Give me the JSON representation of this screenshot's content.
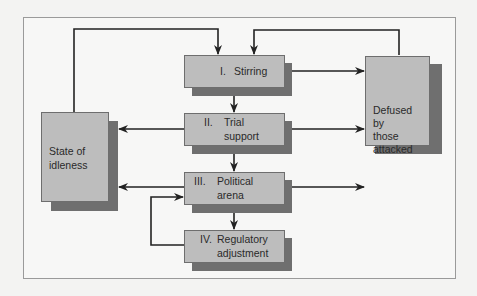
{
  "diagram": {
    "type": "flowchart",
    "colors": {
      "box_fill": "#bdbdbd",
      "shadow": "#6f6f6f",
      "line": "#222222",
      "background": "#f7f7f6"
    },
    "nodes": {
      "stirring": {
        "numeral": "I.",
        "label": "Stirring"
      },
      "trial_support": {
        "numeral": "II.",
        "line1": "Trial",
        "line2": "support"
      },
      "political_arena": {
        "numeral": "III.",
        "line1": "Political",
        "line2": "arena"
      },
      "regulatory_adjustment": {
        "numeral": "IV.",
        "line1": "Regulatory",
        "line2": "adjustment"
      },
      "idleness": {
        "line1": "State of",
        "line2": "idleness"
      },
      "defused": {
        "line1": "Defused",
        "line2": "by",
        "line3": "those",
        "line4": "attacked"
      }
    },
    "edges": [
      {
        "from": "idleness",
        "to": "stirring"
      },
      {
        "from": "defused",
        "to": "stirring"
      },
      {
        "from": "stirring",
        "to": "trial_support"
      },
      {
        "from": "stirring",
        "to": "defused"
      },
      {
        "from": "trial_support",
        "to": "political_arena"
      },
      {
        "from": "trial_support",
        "to": "idleness"
      },
      {
        "from": "trial_support",
        "to": "defused"
      },
      {
        "from": "political_arena",
        "to": "regulatory_adjustment"
      },
      {
        "from": "political_arena",
        "to": "idleness"
      },
      {
        "from": "political_arena",
        "to": "defused"
      },
      {
        "from": "regulatory_adjustment",
        "to": "political_arena"
      }
    ]
  }
}
